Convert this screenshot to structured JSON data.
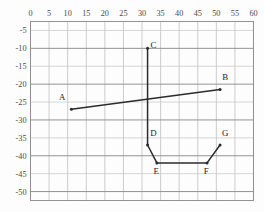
{
  "chart_data": {
    "type": "line",
    "title": "",
    "subtitle": "",
    "xlabel": "",
    "ylabel": "",
    "xlim": [
      0,
      60
    ],
    "ylim": [
      -52.5,
      -2.5
    ],
    "xticks": [
      0,
      5,
      10,
      15,
      20,
      25,
      30,
      35,
      40,
      45,
      50,
      55,
      60
    ],
    "yticks": [
      -5,
      -10,
      -15,
      -20,
      -25,
      -30,
      -35,
      -40,
      -45,
      -50
    ],
    "xtick_labels": [
      "0",
      "5",
      "10",
      "15",
      "20",
      "25",
      "30",
      "35",
      "40",
      "45",
      "50",
      "55",
      "60"
    ],
    "ytick_labels": [
      "-5",
      "-10",
      "-15",
      "-20",
      "-25",
      "-30",
      "-35",
      "-40",
      "-45",
      "-50"
    ],
    "x_axis_position": "top",
    "y_axis_position": "left",
    "grid": true,
    "grid_color": "#b8b8b8",
    "legend": "none",
    "line_color": "#2b2b2b",
    "series": [
      {
        "name": "AB",
        "points": [
          {
            "label": "A",
            "x": 11.0,
            "y": -27.0
          },
          {
            "label": "B",
            "x": 51.0,
            "y": -21.5
          }
        ]
      },
      {
        "name": "CDEFG",
        "points": [
          {
            "label": "C",
            "x": 31.5,
            "y": -10.0
          },
          {
            "label": "D",
            "x": 31.5,
            "y": -37.0
          },
          {
            "label": "E",
            "x": 34.0,
            "y": -42.0
          },
          {
            "label": "F",
            "x": 47.5,
            "y": -42.0
          },
          {
            "label": "G",
            "x": 51.0,
            "y": -37.0
          }
        ]
      }
    ],
    "annotations": [
      {
        "text": "A",
        "x": 11.0,
        "y": -27.0,
        "dx": -2.5,
        "dy": 2.6
      },
      {
        "text": "B",
        "x": 51.0,
        "y": -21.5,
        "dx": 1.4,
        "dy": 2.6
      },
      {
        "text": "C",
        "x": 31.5,
        "y": -10.0,
        "dx": 1.6,
        "dy": 0.2
      },
      {
        "text": "D",
        "x": 31.5,
        "y": -37.0,
        "dx": 1.6,
        "dy": 2.6
      },
      {
        "text": "E",
        "x": 34.0,
        "y": -42.0,
        "dx": -0.2,
        "dy": -3.0
      },
      {
        "text": "F",
        "x": 47.5,
        "y": -42.0,
        "dx": -0.2,
        "dy": -3.0
      },
      {
        "text": "G",
        "x": 51.0,
        "y": -37.0,
        "dx": 1.4,
        "dy": 2.6
      }
    ]
  }
}
